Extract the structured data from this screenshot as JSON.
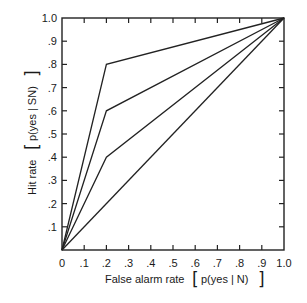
{
  "chart_data": {
    "type": "line",
    "title": "",
    "xlabel": "False alarm rate [p(yes | N)]",
    "ylabel": "Hit rate [p(yes | SN)]",
    "xlabel_text": "False alarm rate",
    "xlabel_math": "p(yes | N)",
    "ylabel_text": "Hit rate",
    "ylabel_math": "p(yes | SN)",
    "xlim": [
      0,
      1.0
    ],
    "ylim": [
      0,
      1.0
    ],
    "grid": false,
    "legend": null,
    "x_ticks": [
      "0",
      ".1",
      ".2",
      ".3",
      ".4",
      ".5",
      ".6",
      ".7",
      ".8",
      ".9",
      "1.0"
    ],
    "y_ticks": [
      ".1",
      ".2",
      ".3",
      ".4",
      ".5",
      ".6",
      ".7",
      ".8",
      ".9",
      "1.0"
    ],
    "series": [
      {
        "name": "curve-0.8",
        "x": [
          0,
          0.2,
          1.0
        ],
        "y": [
          0,
          0.8,
          1.0
        ]
      },
      {
        "name": "curve-0.6",
        "x": [
          0,
          0.2,
          1.0
        ],
        "y": [
          0,
          0.6,
          1.0
        ]
      },
      {
        "name": "curve-0.4",
        "x": [
          0,
          0.2,
          1.0
        ],
        "y": [
          0,
          0.4,
          1.0
        ]
      },
      {
        "name": "chance-diagonal",
        "x": [
          0,
          1.0
        ],
        "y": [
          0,
          1.0
        ]
      }
    ]
  }
}
